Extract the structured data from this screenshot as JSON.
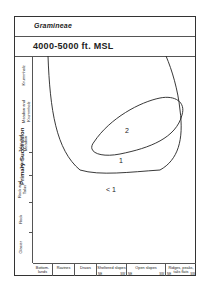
{
  "header": {
    "taxon": "Gramineae",
    "elevation": "4000-5000 ft. MSL"
  },
  "y_axis": {
    "group_label": "Primary Succession",
    "categories": [
      "Glacier",
      "Rock",
      "Rock and Talus",
      "Talus",
      "Talus and Meadow",
      "Meadow",
      "Meadow and Krummholz",
      "Krummholz"
    ]
  },
  "x_axis": {
    "categories": [
      {
        "label": "Bottom-lands"
      },
      {
        "label": "Ravines"
      },
      {
        "label": "Draws"
      },
      {
        "label": "Sheltered slopes",
        "aspects": [
          "NE",
          "SW"
        ]
      },
      {
        "label": "Open slopes",
        "aspects": [
          "NE",
          "SW"
        ]
      },
      {
        "label": "Ridges, peaks, talis flats",
        "aspects": [
          "NE",
          "SW"
        ]
      }
    ]
  },
  "contours": {
    "outer_label": "1",
    "inner_label": "2",
    "outside_label": "< 1"
  },
  "colors": {
    "line": "#222222",
    "background": "#ffffff"
  }
}
